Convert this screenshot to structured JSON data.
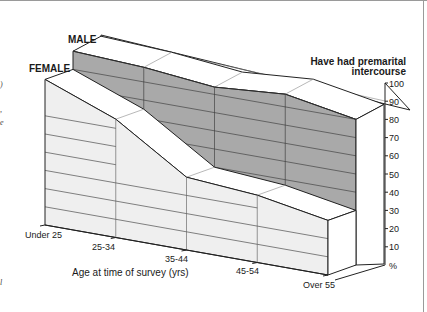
{
  "chart_data": {
    "type": "area",
    "style": "3d-ribbon",
    "title": "Have had premarital intercourse",
    "title_lines": [
      "Have had premarital",
      "intercourse"
    ],
    "xlabel": "Age at time of survey (yrs)",
    "ylabel": "%",
    "categories": [
      "Under 25",
      "25-34",
      "35-44",
      "45-54",
      "Over 55"
    ],
    "yticks": [
      100,
      90,
      80,
      70,
      60,
      50,
      40,
      30,
      20,
      10
    ],
    "ylim": [
      0,
      100
    ],
    "grid": true,
    "series": [
      {
        "name": "MALE",
        "values": [
          90,
          88,
          84,
          87,
          80
        ],
        "color": "#a9a9a9"
      },
      {
        "name": "FEMALE",
        "values": [
          80,
          65,
          40,
          37,
          30
        ],
        "color": "#efefef"
      }
    ],
    "legend": {
      "position": "series-labels-left"
    }
  },
  "labels": {
    "male": "MALE",
    "female": "FEMALE",
    "title_line1": "Have had premarital",
    "title_line2": "intercourse",
    "xlabel": "Age at time of survey (yrs)",
    "unit": "%"
  }
}
